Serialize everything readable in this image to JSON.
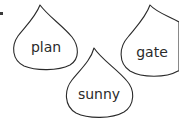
{
  "worksheet": {
    "drops": [
      {
        "word": "plan"
      },
      {
        "word": "gate"
      },
      {
        "word": "sunny"
      }
    ]
  },
  "colors": {
    "outline": "#2a2a2a",
    "text": "#2a2a2a",
    "background": "#ffffff"
  }
}
